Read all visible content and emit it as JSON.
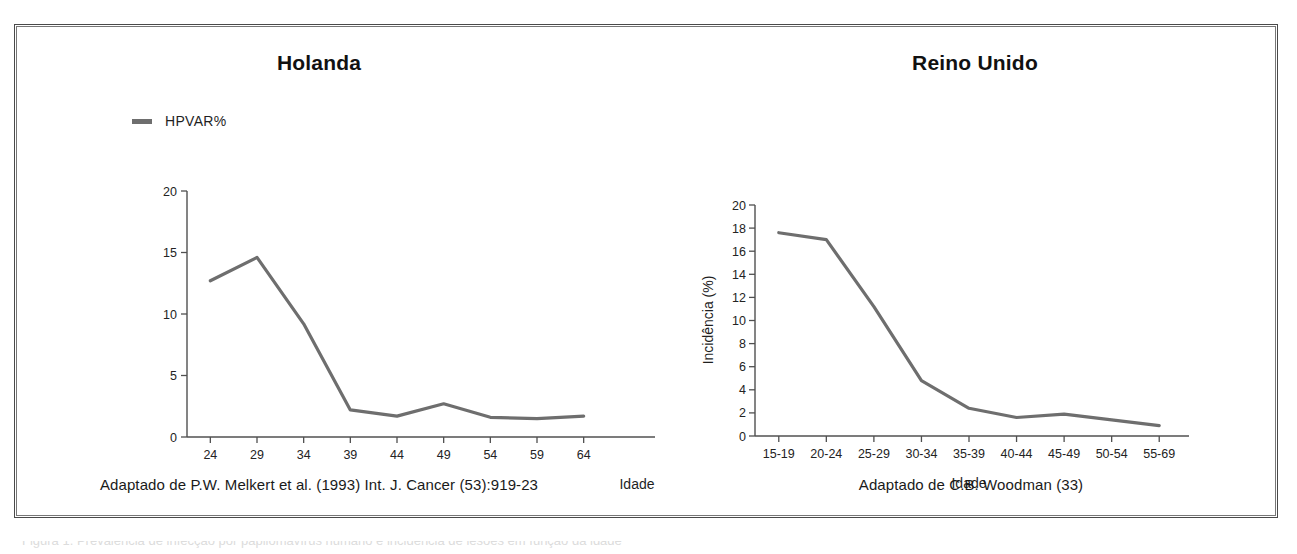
{
  "figure": {
    "background_color": "#ffffff",
    "border_color": "#4a4a4a",
    "series_color": "#6e6e6e",
    "axis_color": "#505050"
  },
  "panels": {
    "left": {
      "title": "Holanda",
      "legend": {
        "label": "HPVAR%",
        "swatch_color": "#6e6e6e"
      },
      "source": "Adaptado de P.W. Melkert et al. (1993) Int. J. Cancer (53):919-23"
    },
    "right": {
      "title": "Reino Unido",
      "source": "Adaptado de C.B. Woodman (33)"
    }
  },
  "footer_sliver": "Figura 1. Prevalência de infecção por papilomavírus humano e incidência de lesões em função da idade",
  "chart_data": [
    {
      "id": "holanda",
      "type": "line",
      "title": "Holanda",
      "xlabel": "Idade",
      "ylabel": "",
      "legend": [
        "HPVAR%"
      ],
      "legend_position": "above-plot-left",
      "grid": false,
      "categories": [
        "24",
        "29",
        "34",
        "39",
        "44",
        "49",
        "54",
        "59",
        "64"
      ],
      "yticks": [
        0,
        5,
        10,
        15,
        20
      ],
      "ylim": [
        0,
        20
      ],
      "series": [
        {
          "name": "HPVAR%",
          "color": "#6e6e6e",
          "values": [
            12.7,
            14.6,
            9.2,
            2.2,
            1.7,
            2.7,
            1.6,
            1.5,
            1.7
          ]
        }
      ]
    },
    {
      "id": "reino-unido",
      "type": "line",
      "title": "Reino Unido",
      "xlabel": "Idade",
      "ylabel": "Incidência (%)",
      "legend": [],
      "grid": false,
      "categories": [
        "15-19",
        "20-24",
        "25-29",
        "30-34",
        "35-39",
        "40-44",
        "45-49",
        "50-54",
        "55-69"
      ],
      "yticks": [
        0,
        2,
        4,
        6,
        8,
        10,
        12,
        14,
        16,
        18,
        20
      ],
      "ylim": [
        0,
        20
      ],
      "series": [
        {
          "name": "Incidência (%)",
          "color": "#6e6e6e",
          "values": [
            17.6,
            17.0,
            11.2,
            4.8,
            2.4,
            1.6,
            1.9,
            1.4,
            0.9
          ]
        }
      ]
    }
  ]
}
